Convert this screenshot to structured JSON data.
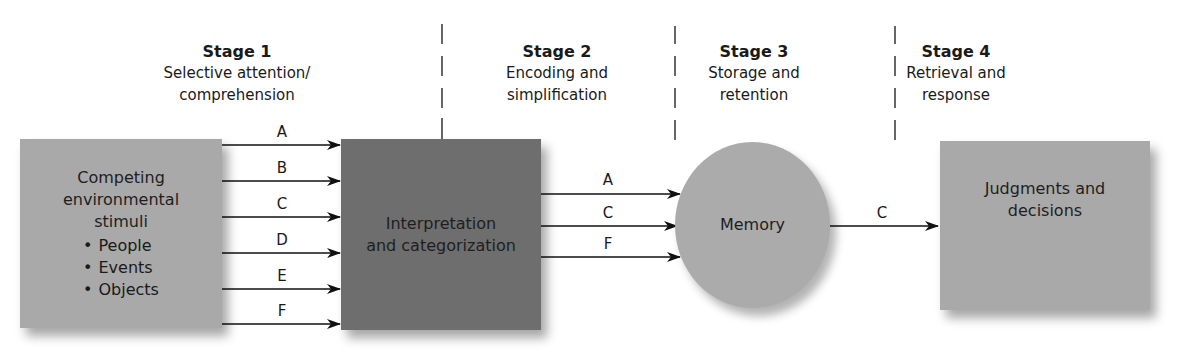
{
  "stages": [
    {
      "title": "Stage 1",
      "desc_lines": [
        "Selective attention/",
        "comprehension"
      ]
    },
    {
      "title": "Stage 2",
      "desc_lines": [
        "Encoding and",
        "simplification"
      ]
    },
    {
      "title": "Stage 3",
      "desc_lines": [
        "Storage and",
        "retention"
      ]
    },
    {
      "title": "Stage 4",
      "desc_lines": [
        "Retrieval and",
        "response"
      ]
    }
  ],
  "nodes": {
    "stimuli": {
      "title_lines": [
        "Competing",
        "environmental",
        "stimuli"
      ],
      "items": [
        "People",
        "Events",
        "Objects"
      ],
      "color": "#a9a9a9"
    },
    "interpretation": {
      "lines": [
        "Interpretation",
        "and categorization"
      ],
      "color": "#6e6e6e"
    },
    "memory": {
      "label": "Memory",
      "color": "#ababab"
    },
    "judgments": {
      "lines": [
        "Judgments and",
        "decisions"
      ],
      "color": "#a9a9a9"
    }
  },
  "edges": {
    "stimuli_to_interpretation": [
      "A",
      "B",
      "C",
      "D",
      "E",
      "F"
    ],
    "interpretation_to_memory": [
      "A",
      "C",
      "F"
    ],
    "memory_to_judgments": [
      "C"
    ]
  }
}
